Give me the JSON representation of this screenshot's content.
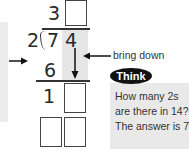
{
  "division": {
    "divisor": "2",
    "dividend": [
      "7",
      "4"
    ],
    "quotient": [
      "3",
      ""
    ],
    "steps": [
      {
        "row": "product",
        "digits": [
          "6",
          ""
        ]
      },
      {
        "row": "difference",
        "digits": [
          "1",
          ""
        ]
      },
      {
        "row": "product2",
        "digits": [
          "",
          ""
        ]
      }
    ]
  },
  "annotations": {
    "bring_down_label": "bring down"
  },
  "think": {
    "badge": "Think",
    "lines": [
      "How many 2s",
      "are there in 14?",
      "The answer is 7."
    ]
  },
  "icons": [
    "arrow-right-icon",
    "arrow-left-icon",
    "arrow-down-icon"
  ],
  "colors": {
    "highlight": "#e6e6e6",
    "badge": "#111111",
    "think_box": "#e9e9e9"
  }
}
